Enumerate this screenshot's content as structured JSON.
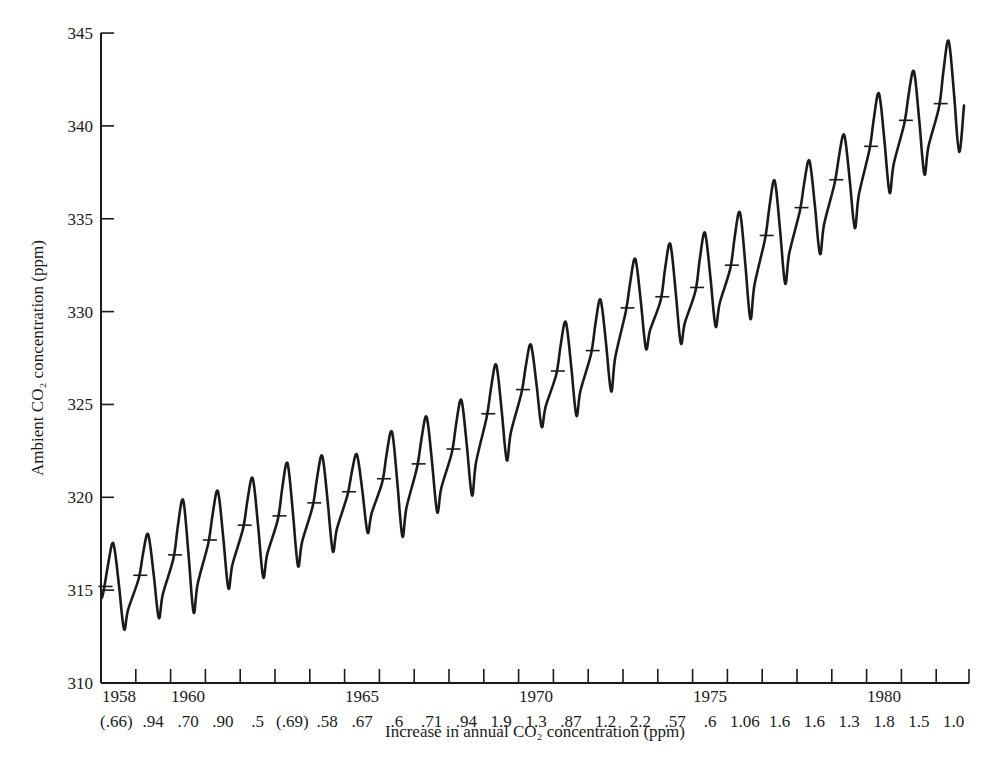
{
  "chart_data": {
    "type": "line",
    "title": "",
    "ylabel": "Ambient CO₂ concentration (ppm)",
    "xlabel": "Increase in annual CO₂ concentration (ppm)",
    "ylim": [
      310,
      345
    ],
    "yticks": [
      310,
      315,
      320,
      325,
      330,
      335,
      340,
      345
    ],
    "x_tick_labels": [
      {
        "label": "1958",
        "year": 1958
      },
      {
        "label": "1960",
        "year": 1960
      },
      {
        "label": "1965",
        "year": 1965
      },
      {
        "label": "1970",
        "year": 1970
      },
      {
        "label": "1975",
        "year": 1975
      },
      {
        "label": "1980",
        "year": 1980
      }
    ],
    "years": [
      1958,
      1959,
      1960,
      1961,
      1962,
      1963,
      1964,
      1965,
      1966,
      1967,
      1968,
      1969,
      1970,
      1971,
      1972,
      1973,
      1974,
      1975,
      1976,
      1977,
      1978,
      1979,
      1980,
      1981,
      1982
    ],
    "annual_increase_labels": [
      "(.66)",
      ".94",
      ".70",
      ".90",
      ".5",
      "(.69)",
      ".58",
      ".67",
      ".6",
      ".71",
      ".94",
      "1.9",
      "1.3",
      ".87",
      "1.2",
      "2.2",
      ".57",
      ".6",
      "1.06",
      "1.6",
      "1.6",
      "1.3",
      "1.8",
      "1.5",
      "1.0"
    ],
    "series": [
      {
        "name": "Seasonal maximum (ppm)",
        "values": [
          317.5,
          318.0,
          319.8,
          320.3,
          321.0,
          321.8,
          322.2,
          322.3,
          323.5,
          324.3,
          325.2,
          327.1,
          328.2,
          329.4,
          330.6,
          332.8,
          333.6,
          334.2,
          335.3,
          337.0,
          338.1,
          339.5,
          341.7,
          342.9,
          344.5
        ]
      },
      {
        "name": "Seasonal minimum (ppm)",
        "values": [
          312.9,
          313.5,
          313.8,
          315.1,
          315.7,
          316.3,
          317.1,
          318.1,
          317.9,
          319.2,
          320.1,
          322.0,
          323.8,
          324.4,
          325.7,
          328.0,
          328.3,
          329.2,
          329.6,
          331.5,
          333.1,
          334.5,
          336.4,
          337.4,
          338.6
        ]
      },
      {
        "name": "Annual mean (tick marks, ppm)",
        "values": [
          315.2,
          315.8,
          316.9,
          317.7,
          318.5,
          319.0,
          319.7,
          320.3,
          321.0,
          321.8,
          322.6,
          324.5,
          325.8,
          326.8,
          327.9,
          330.2,
          330.8,
          331.3,
          332.5,
          334.1,
          335.6,
          337.1,
          338.9,
          340.3,
          341.2
        ]
      }
    ],
    "series_start_value": 314.6,
    "series_end_value": 341.1,
    "grid": false,
    "legend": "none",
    "line_color": "#1a1a1a",
    "background_color": "#ffffff"
  }
}
